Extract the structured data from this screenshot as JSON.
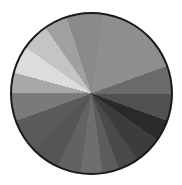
{
  "wheel": {
    "border_color": "#1a1a1a",
    "segments": [
      {
        "from": -8,
        "to": 8,
        "color": "#8a8a8a"
      },
      {
        "from": 8,
        "to": 70,
        "color": "#8e8e8e"
      },
      {
        "from": 70,
        "to": 90,
        "color": "#6a6a6a"
      },
      {
        "from": 90,
        "to": 110,
        "color": "#505050"
      },
      {
        "from": 110,
        "to": 125,
        "color": "#2a2a2a"
      },
      {
        "from": 125,
        "to": 145,
        "color": "#3c3c3c"
      },
      {
        "from": 145,
        "to": 160,
        "color": "#4a4a4a"
      },
      {
        "from": 160,
        "to": 172,
        "color": "#5c5c5c"
      },
      {
        "from": 172,
        "to": 188,
        "color": "#6e6e6e"
      },
      {
        "from": 188,
        "to": 205,
        "color": "#626262"
      },
      {
        "from": 205,
        "to": 225,
        "color": "#555555"
      },
      {
        "from": 225,
        "to": 250,
        "color": "#5a5a5a"
      },
      {
        "from": 250,
        "to": 270,
        "color": "#7a7a7a"
      },
      {
        "from": 270,
        "to": 285,
        "color": "#a8a8a8"
      },
      {
        "from": 285,
        "to": 305,
        "color": "#dcdcdc"
      },
      {
        "from": 305,
        "to": 325,
        "color": "#c4c4c4"
      },
      {
        "from": 325,
        "to": 342,
        "color": "#a0a0a0"
      },
      {
        "from": 342,
        "to": 352,
        "color": "#8a8a8a"
      }
    ]
  }
}
